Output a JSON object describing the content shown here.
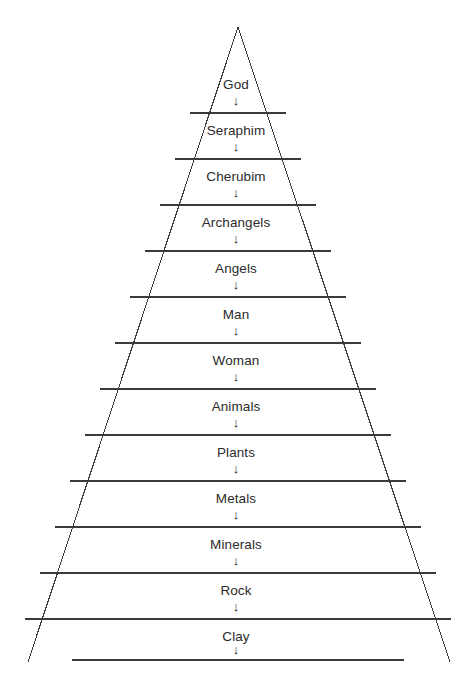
{
  "diagram": {
    "shape": "triangle",
    "arrow_glyph": "↓",
    "line_color": "#3a3a3a",
    "text_color": "#2b2b2b",
    "background_color": "#ffffff",
    "apex": {
      "x": 238,
      "y": 27
    },
    "base_left": {
      "x": 28,
      "y": 662
    },
    "base_right": {
      "x": 450,
      "y": 662
    },
    "levels": [
      {
        "label": "God",
        "label_y": 85,
        "arrow_y": 101,
        "divider_y": 113,
        "divider_half_width": 48
      },
      {
        "label": "Seraphim",
        "label_y": 131,
        "arrow_y": 147,
        "divider_y": 159,
        "divider_half_width": 63
      },
      {
        "label": "Cherubim",
        "label_y": 177,
        "arrow_y": 193,
        "divider_y": 205,
        "divider_half_width": 78
      },
      {
        "label": "Archangels",
        "label_y": 223,
        "arrow_y": 239,
        "divider_y": 251,
        "divider_half_width": 93
      },
      {
        "label": "Angels",
        "label_y": 269,
        "arrow_y": 285,
        "divider_y": 297,
        "divider_half_width": 108
      },
      {
        "label": "Man",
        "label_y": 315,
        "arrow_y": 331,
        "divider_y": 343,
        "divider_half_width": 123
      },
      {
        "label": "Woman",
        "label_y": 361,
        "arrow_y": 377,
        "divider_y": 389,
        "divider_half_width": 138
      },
      {
        "label": "Animals",
        "label_y": 407,
        "arrow_y": 423,
        "divider_y": 435,
        "divider_half_width": 153
      },
      {
        "label": "Plants",
        "label_y": 453,
        "arrow_y": 469,
        "divider_y": 481,
        "divider_half_width": 168
      },
      {
        "label": "Metals",
        "label_y": 499,
        "arrow_y": 515,
        "divider_y": 527,
        "divider_half_width": 183
      },
      {
        "label": "Minerals",
        "label_y": 545,
        "arrow_y": 561,
        "divider_y": 573,
        "divider_half_width": 198
      },
      {
        "label": "Rock",
        "label_y": 591,
        "arrow_y": 607,
        "divider_y": 619,
        "divider_half_width": 213
      },
      {
        "label": "Clay",
        "label_y": 637,
        "arrow_y": 650,
        "divider_y": 660,
        "divider_half_width": 166
      }
    ]
  }
}
